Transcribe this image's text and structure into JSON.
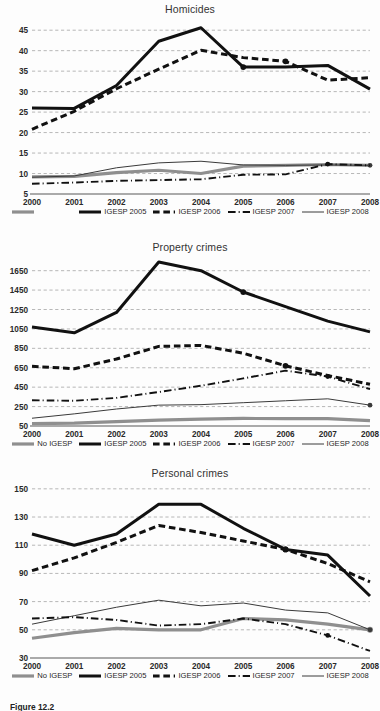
{
  "figure": {
    "caption": "Figure 12.2"
  },
  "series_styles": {
    "no_igesp": {
      "color": "#8f8f8f",
      "width": 3.2,
      "dash": "none"
    },
    "igesp_2005": {
      "color": "#111111",
      "width": 3.0,
      "dash": "none"
    },
    "igesp_2006": {
      "color": "#111111",
      "width": 3.0,
      "dash": "dashed"
    },
    "igesp_2007": {
      "color": "#111111",
      "width": 1.9,
      "dash": "dashdot"
    },
    "igesp_2008": {
      "color": "#3a3a3a",
      "width": 1.0,
      "dash": "none"
    }
  },
  "legend": {
    "items": [
      {
        "key": "no_igesp",
        "label": "No IGESP"
      },
      {
        "key": "igesp_2005",
        "label": "IGESP 2005"
      },
      {
        "key": "igesp_2006",
        "label": "IGESP 2006"
      },
      {
        "key": "igesp_2007",
        "label": "IGESP 2007"
      },
      {
        "key": "igesp_2008",
        "label": "IGESP 2008"
      }
    ]
  },
  "chart_data": [
    {
      "id": "homicides",
      "type": "line",
      "title": "Homicides",
      "xlabel": "",
      "ylabel": "",
      "grid": true,
      "legend_position": "bottom",
      "legend_first_label_hidden": true,
      "categories": [
        "2000",
        "2001",
        "2002",
        "2003",
        "2004",
        "2005",
        "2006",
        "2007",
        "2008"
      ],
      "ylim": [
        5,
        47
      ],
      "yticks": [
        5,
        10,
        15,
        20,
        25,
        30,
        35,
        40,
        45
      ],
      "series": [
        {
          "key": "no_igesp",
          "name": "No IGESP",
          "values": [
            9.2,
            9.3,
            10.2,
            10.8,
            10.0,
            11.8,
            12.0,
            12.2,
            12.0
          ],
          "markers": []
        },
        {
          "key": "igesp_2005",
          "name": "IGESP 2005",
          "values": [
            26.0,
            25.9,
            31.5,
            42.3,
            45.6,
            36.0,
            36.0,
            36.4,
            30.6
          ],
          "markers": [
            5
          ]
        },
        {
          "key": "igesp_2006",
          "name": "IGESP 2006",
          "values": [
            20.8,
            25.2,
            30.7,
            35.5,
            40.1,
            38.3,
            37.4,
            32.8,
            33.4
          ],
          "markers": [
            6
          ]
        },
        {
          "key": "igesp_2007",
          "name": "IGESP 2007",
          "values": [
            7.5,
            7.8,
            8.2,
            8.4,
            8.6,
            9.7,
            9.8,
            12.3,
            12.0
          ],
          "markers": [
            7
          ]
        },
        {
          "key": "igesp_2008",
          "name": "IGESP 2008",
          "values": [
            9.1,
            9.4,
            11.4,
            12.6,
            13.0,
            12.1,
            12.0,
            12.1,
            12.0
          ],
          "markers": [
            8
          ]
        }
      ]
    },
    {
      "id": "property",
      "type": "line",
      "title": "Property crimes",
      "xlabel": "",
      "ylabel": "",
      "grid": true,
      "legend_position": "bottom",
      "legend_first_label_hidden": false,
      "categories": [
        "2000",
        "2001",
        "2002",
        "2003",
        "2004",
        "2005",
        "2006",
        "2007",
        "2008"
      ],
      "ylim": [
        50,
        1760
      ],
      "yticks": [
        50,
        250,
        450,
        650,
        850,
        1050,
        1250,
        1450,
        1650
      ],
      "series": [
        {
          "key": "no_igesp",
          "name": "No IGESP",
          "values": [
            75,
            80,
            95,
            110,
            120,
            128,
            125,
            125,
            105
          ],
          "markers": []
        },
        {
          "key": "igesp_2005",
          "name": "IGESP 2005",
          "values": [
            1070,
            1010,
            1220,
            1740,
            1650,
            1430,
            1280,
            1130,
            1020
          ],
          "markers": [
            5
          ]
        },
        {
          "key": "igesp_2006",
          "name": "IGESP 2006",
          "values": [
            665,
            640,
            740,
            870,
            880,
            800,
            670,
            570,
            480
          ],
          "markers": [
            6
          ]
        },
        {
          "key": "igesp_2007",
          "name": "IGESP 2007",
          "values": [
            315,
            310,
            340,
            400,
            465,
            540,
            620,
            560,
            430
          ],
          "markers": [
            7
          ]
        },
        {
          "key": "igesp_2008",
          "name": "IGESP 2008",
          "values": [
            130,
            175,
            225,
            265,
            270,
            290,
            310,
            330,
            265
          ],
          "markers": [
            8
          ]
        }
      ]
    },
    {
      "id": "personal",
      "type": "line",
      "title": "Personal crimes",
      "xlabel": "",
      "ylabel": "",
      "grid": true,
      "legend_position": "bottom",
      "legend_first_label_hidden": false,
      "categories": [
        "2000",
        "2001",
        "2002",
        "2003",
        "2004",
        "2005",
        "2006",
        "2007",
        "2008"
      ],
      "ylim": [
        30,
        152
      ],
      "yticks": [
        30,
        50,
        70,
        90,
        110,
        130,
        150
      ],
      "series": [
        {
          "key": "no_igesp",
          "name": "No IGESP",
          "values": [
            44,
            48,
            51,
            50,
            50,
            58,
            57,
            54,
            50
          ],
          "markers": [
            8
          ]
        },
        {
          "key": "igesp_2005",
          "name": "IGESP 2005",
          "values": [
            118,
            110,
            118,
            139,
            139,
            122,
            107,
            103,
            74
          ],
          "markers": [
            6
          ]
        },
        {
          "key": "igesp_2006",
          "name": "IGESP 2006",
          "values": [
            92,
            101,
            112,
            124,
            119,
            113,
            107,
            97,
            84
          ],
          "markers": [
            6
          ]
        },
        {
          "key": "igesp_2007",
          "name": "IGESP 2007",
          "values": [
            58,
            59,
            57,
            53,
            54,
            58,
            54,
            46,
            35
          ],
          "markers": [
            7
          ]
        },
        {
          "key": "igesp_2008",
          "name": "IGESP 2008",
          "values": [
            54,
            60,
            66,
            71,
            67,
            69,
            64,
            62,
            50
          ],
          "markers": [
            8
          ]
        }
      ]
    }
  ]
}
